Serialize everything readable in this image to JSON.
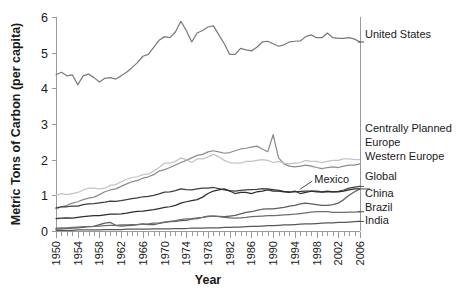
{
  "chart_data": {
    "type": "line",
    "title": "",
    "xlabel": "Year",
    "ylabel": "Metric Tons of Carbon (per capita)",
    "xlim": [
      1950,
      2006
    ],
    "ylim": [
      0,
      6
    ],
    "yticks": [
      0,
      1,
      2,
      3,
      4,
      5,
      6
    ],
    "xticks": [
      1950,
      1954,
      1958,
      1962,
      1966,
      1970,
      1974,
      1978,
      1982,
      1986,
      1990,
      1994,
      1998,
      2002,
      2006
    ],
    "xtick_labels": [
      "1950",
      "1954",
      "1958",
      "1962",
      "1966",
      "1970",
      "1974",
      "1978",
      "1982",
      "1986",
      "1990",
      "1994",
      "1998",
      "2002",
      "2006"
    ],
    "ytick_labels": [
      "0",
      "1",
      "2",
      "3",
      "4",
      "5",
      "6"
    ],
    "xtick_minor_interval": 1,
    "grid": false,
    "legend_position": "right-inline",
    "annotations": [
      {
        "text": "Mexico",
        "series": "Mexico",
        "x": 1995,
        "y": 1.12
      }
    ],
    "x": [
      1950,
      1951,
      1952,
      1953,
      1954,
      1955,
      1956,
      1957,
      1958,
      1959,
      1960,
      1961,
      1962,
      1963,
      1964,
      1965,
      1966,
      1967,
      1968,
      1969,
      1970,
      1971,
      1972,
      1973,
      1974,
      1975,
      1976,
      1977,
      1978,
      1979,
      1980,
      1981,
      1982,
      1983,
      1984,
      1985,
      1986,
      1987,
      1988,
      1989,
      1990,
      1991,
      1992,
      1993,
      1994,
      1995,
      1996,
      1997,
      1998,
      1999,
      2000,
      2001,
      2002,
      2003,
      2004,
      2005,
      2006
    ],
    "series": [
      {
        "name": "United States",
        "color": "#7a7a7a",
        "label_y": 5.35,
        "values": [
          4.38,
          4.45,
          4.35,
          4.38,
          4.1,
          4.35,
          4.4,
          4.3,
          4.18,
          4.28,
          4.3,
          4.26,
          4.35,
          4.45,
          4.58,
          4.72,
          4.9,
          4.95,
          5.15,
          5.35,
          5.45,
          5.42,
          5.58,
          5.88,
          5.62,
          5.3,
          5.55,
          5.62,
          5.72,
          5.75,
          5.5,
          5.25,
          4.95,
          4.95,
          5.12,
          5.08,
          5.05,
          5.15,
          5.3,
          5.32,
          5.25,
          5.18,
          5.22,
          5.3,
          5.32,
          5.33,
          5.45,
          5.5,
          5.42,
          5.42,
          5.55,
          5.42,
          5.4,
          5.4,
          5.42,
          5.38,
          5.3
        ]
      },
      {
        "name": "Centrally Planned Europe",
        "color": "#8c8c8c",
        "label_y": 2.4,
        "values": [
          0.62,
          0.68,
          0.72,
          0.78,
          0.82,
          0.88,
          0.92,
          0.95,
          1.02,
          1.1,
          1.15,
          1.18,
          1.25,
          1.32,
          1.38,
          1.42,
          1.48,
          1.52,
          1.58,
          1.68,
          1.72,
          1.78,
          1.85,
          1.92,
          1.98,
          2.05,
          2.12,
          2.15,
          2.22,
          2.25,
          2.22,
          2.18,
          2.2,
          2.25,
          2.3,
          2.32,
          2.35,
          2.38,
          2.3,
          2.22,
          2.7,
          2.05,
          1.88,
          1.82,
          1.8,
          1.82,
          1.85,
          1.82,
          1.78,
          1.75,
          1.78,
          1.8,
          1.78,
          1.82,
          1.85,
          1.85,
          1.88
        ]
      },
      {
        "name": "Western Europe",
        "color": "#c4c4c4",
        "label_y": 2.02,
        "values": [
          1.0,
          1.05,
          1.02,
          1.05,
          1.08,
          1.15,
          1.2,
          1.2,
          1.18,
          1.2,
          1.28,
          1.3,
          1.38,
          1.45,
          1.5,
          1.52,
          1.58,
          1.6,
          1.68,
          1.78,
          1.9,
          1.9,
          1.95,
          2.05,
          2.0,
          1.92,
          2.02,
          2.02,
          2.08,
          2.15,
          2.08,
          1.98,
          1.92,
          1.9,
          1.9,
          1.95,
          1.95,
          1.98,
          2.0,
          1.98,
          1.92,
          1.95,
          1.9,
          1.88,
          1.9,
          1.92,
          1.98,
          1.95,
          1.95,
          1.92,
          1.95,
          1.98,
          1.98,
          2.02,
          2.02,
          2.0,
          2.0
        ]
      },
      {
        "name": "Global",
        "color": "#3d3d3d",
        "label_y": 1.22,
        "values": [
          0.65,
          0.68,
          0.68,
          0.7,
          0.7,
          0.74,
          0.76,
          0.77,
          0.79,
          0.81,
          0.84,
          0.83,
          0.85,
          0.88,
          0.91,
          0.93,
          0.96,
          0.97,
          1.0,
          1.04,
          1.09,
          1.1,
          1.13,
          1.18,
          1.16,
          1.15,
          1.18,
          1.2,
          1.2,
          1.22,
          1.19,
          1.15,
          1.13,
          1.12,
          1.14,
          1.15,
          1.16,
          1.17,
          1.19,
          1.18,
          1.16,
          1.14,
          1.11,
          1.1,
          1.1,
          1.11,
          1.12,
          1.12,
          1.1,
          1.09,
          1.1,
          1.1,
          1.11,
          1.15,
          1.2,
          1.23,
          1.25
        ]
      },
      {
        "name": "Mexico",
        "color": "#2e2e2e",
        "label_y": 1.12,
        "values": [
          0.35,
          0.36,
          0.37,
          0.36,
          0.38,
          0.4,
          0.42,
          0.43,
          0.43,
          0.45,
          0.47,
          0.47,
          0.48,
          0.5,
          0.53,
          0.55,
          0.56,
          0.58,
          0.6,
          0.63,
          0.66,
          0.68,
          0.72,
          0.78,
          0.82,
          0.85,
          0.88,
          0.95,
          1.05,
          1.12,
          1.15,
          1.18,
          1.12,
          1.05,
          1.08,
          1.08,
          1.05,
          1.1,
          1.12,
          1.15,
          1.12,
          1.12,
          1.1,
          1.08,
          1.12,
          1.05,
          1.08,
          1.12,
          1.12,
          1.1,
          1.12,
          1.1,
          1.1,
          1.12,
          1.15,
          1.18,
          1.18
        ]
      },
      {
        "name": "China",
        "color": "#5c5c5c",
        "label_y": 1.0,
        "values": [
          0.05,
          0.06,
          0.07,
          0.08,
          0.09,
          0.1,
          0.12,
          0.13,
          0.18,
          0.22,
          0.24,
          0.16,
          0.14,
          0.15,
          0.16,
          0.18,
          0.2,
          0.18,
          0.18,
          0.21,
          0.24,
          0.26,
          0.27,
          0.29,
          0.3,
          0.33,
          0.35,
          0.38,
          0.42,
          0.42,
          0.41,
          0.4,
          0.42,
          0.44,
          0.48,
          0.52,
          0.54,
          0.58,
          0.61,
          0.62,
          0.62,
          0.64,
          0.66,
          0.7,
          0.72,
          0.76,
          0.78,
          0.76,
          0.74,
          0.72,
          0.72,
          0.74,
          0.78,
          0.88,
          1.0,
          1.1,
          1.18
        ]
      },
      {
        "name": "Brazil",
        "color": "#6e6e6e",
        "label_y": 0.56,
        "values": [
          0.08,
          0.09,
          0.09,
          0.1,
          0.11,
          0.12,
          0.12,
          0.13,
          0.14,
          0.15,
          0.16,
          0.16,
          0.17,
          0.17,
          0.18,
          0.18,
          0.19,
          0.2,
          0.22,
          0.23,
          0.25,
          0.27,
          0.29,
          0.32,
          0.34,
          0.35,
          0.37,
          0.38,
          0.4,
          0.42,
          0.4,
          0.38,
          0.37,
          0.36,
          0.37,
          0.38,
          0.4,
          0.41,
          0.42,
          0.43,
          0.43,
          0.44,
          0.45,
          0.46,
          0.47,
          0.49,
          0.51,
          0.53,
          0.54,
          0.54,
          0.54,
          0.52,
          0.52,
          0.52,
          0.53,
          0.53,
          0.54
        ]
      },
      {
        "name": "India",
        "color": "#585858",
        "label_y": 0.32,
        "values": [
          0.02,
          0.02,
          0.02,
          0.02,
          0.03,
          0.03,
          0.03,
          0.03,
          0.03,
          0.04,
          0.04,
          0.04,
          0.04,
          0.05,
          0.05,
          0.05,
          0.05,
          0.05,
          0.06,
          0.06,
          0.06,
          0.06,
          0.07,
          0.07,
          0.07,
          0.08,
          0.08,
          0.08,
          0.09,
          0.09,
          0.09,
          0.1,
          0.1,
          0.11,
          0.11,
          0.12,
          0.13,
          0.13,
          0.14,
          0.15,
          0.15,
          0.16,
          0.17,
          0.17,
          0.18,
          0.19,
          0.2,
          0.2,
          0.21,
          0.22,
          0.23,
          0.23,
          0.24,
          0.24,
          0.25,
          0.26,
          0.27
        ]
      }
    ],
    "legend_entries": [
      {
        "label": "United States"
      },
      {
        "label": "Centrally Planned"
      },
      {
        "label": "Europe"
      },
      {
        "label": "Western Europe"
      },
      {
        "label": "Global"
      },
      {
        "label": "China"
      },
      {
        "label": "Brazil"
      },
      {
        "label": "India"
      }
    ]
  }
}
